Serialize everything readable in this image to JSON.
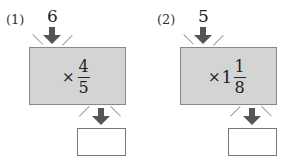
{
  "problems": [
    {
      "label": "(1)",
      "input": "6",
      "operator": "×",
      "whole": "",
      "numerator": "4",
      "denominator": "5",
      "answer": ""
    },
    {
      "label": "(2)",
      "input": "5",
      "operator": "×",
      "whole": "1",
      "numerator": "1",
      "denominator": "8",
      "answer": ""
    }
  ],
  "colors": {
    "machine_fill": "#d4d4d4",
    "arrow": "#555555",
    "ray": "#999999"
  }
}
